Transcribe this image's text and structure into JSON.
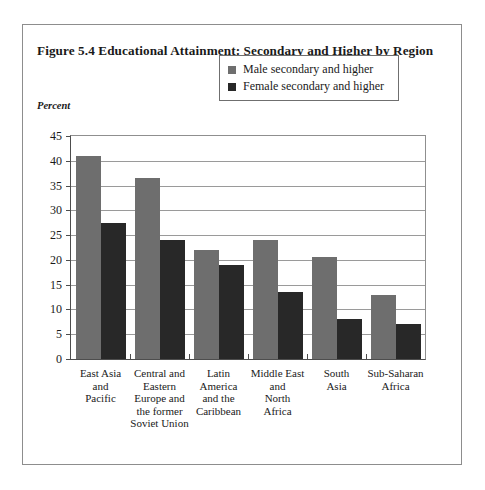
{
  "figure": {
    "title": "Figure 5.4 Educational Attainment: Secondary and Higher by Region",
    "axis_unit_label": "Percent"
  },
  "legend": {
    "position": "inside-top-right",
    "entries": [
      {
        "label": "Male secondary and higher",
        "color": "#6e6e6e",
        "key": "male"
      },
      {
        "label": "Female secondary and higher",
        "color": "#282828",
        "key": "female"
      }
    ]
  },
  "chart_data": {
    "type": "bar",
    "title": "Figure 5.4 Educational Attainment: Secondary and Higher by Region",
    "xlabel": "",
    "ylabel": "Percent",
    "ylim": [
      0,
      45
    ],
    "yticks": [
      0,
      5,
      10,
      15,
      20,
      25,
      30,
      35,
      40,
      45
    ],
    "ytick_labels": [
      "0",
      "5",
      "10",
      "15",
      "20",
      "25",
      "30",
      "35",
      "40",
      "45"
    ],
    "grid": true,
    "categories": [
      "East Asia\nand\nPacific",
      "Central and\nEastern\nEurope and\nthe former\nSoviet Union",
      "Latin\nAmerica\nand the\nCaribbean",
      "Middle East\nand\nNorth\nAfrica",
      "South\nAsia",
      "Sub-Saharan\nAfrica"
    ],
    "series": [
      {
        "name": "Male secondary and higher",
        "color": "#6e6e6e",
        "values": [
          41,
          36.5,
          22,
          24,
          20.5,
          13
        ]
      },
      {
        "name": "Female secondary and higher",
        "color": "#282828",
        "values": [
          27.5,
          24,
          19,
          13.5,
          8,
          7
        ]
      }
    ]
  }
}
